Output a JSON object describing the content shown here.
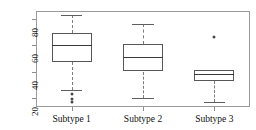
{
  "chart_data": {
    "type": "box",
    "title": "",
    "xlabel": "",
    "ylabel": "",
    "categories": [
      "Subtype 1",
      "Subtype 2",
      "Subtype 3"
    ],
    "ylim": [
      13,
      86
    ],
    "yticks": [
      20,
      40,
      60,
      80
    ],
    "ytick_labels": [
      "20",
      "40",
      "60",
      "80"
    ],
    "grid": false,
    "legend": "none",
    "boxes": [
      {
        "name": "Subtype 1",
        "whisker_low": 26,
        "q1": 47,
        "median": 60,
        "q3": 69,
        "whisker_high": 83,
        "outliers": [
          23,
          19,
          17
        ]
      },
      {
        "name": "Subtype 2",
        "whisker_low": 20,
        "q1": 40,
        "median": 51,
        "q3": 61,
        "whisker_high": 76,
        "outliers": []
      },
      {
        "name": "Subtype 3",
        "whisker_low": 17,
        "q1": 33,
        "median": 38,
        "q3": 41,
        "whisker_high": 35,
        "outliers": [
          66
        ]
      }
    ]
  },
  "axis": {
    "tick_20": "20",
    "tick_40": "40",
    "tick_60": "60",
    "tick_80": "80"
  },
  "labels": {
    "cat_1": "Subtype 1",
    "cat_2": "Subtype 2",
    "cat_3": "Subtype 3"
  },
  "colors": {
    "box_stroke": "#575757",
    "median_stroke": "#3a3a3a",
    "whisker_stroke": "#7c7c7c",
    "outlier_fill": "#4a4a4a",
    "frame": "#9a9a9a",
    "text": "#101010",
    "background": "#ffffff"
  }
}
